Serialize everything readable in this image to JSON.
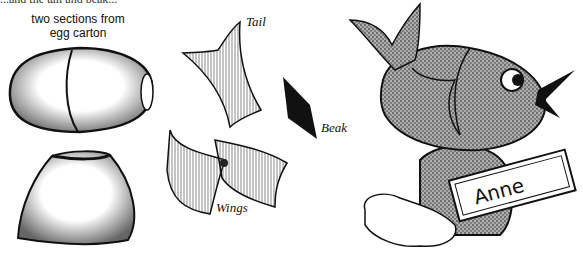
{
  "top_caption_partial": "...and the tail and beak...",
  "labels": {
    "egg_carton": [
      "two sections from",
      "egg carton"
    ],
    "tail": "Tail",
    "beak": "Beak",
    "wings": "Wings",
    "name_tag": "Anne"
  },
  "colors": {
    "ink": "#111111",
    "paper": "#ffffff"
  }
}
